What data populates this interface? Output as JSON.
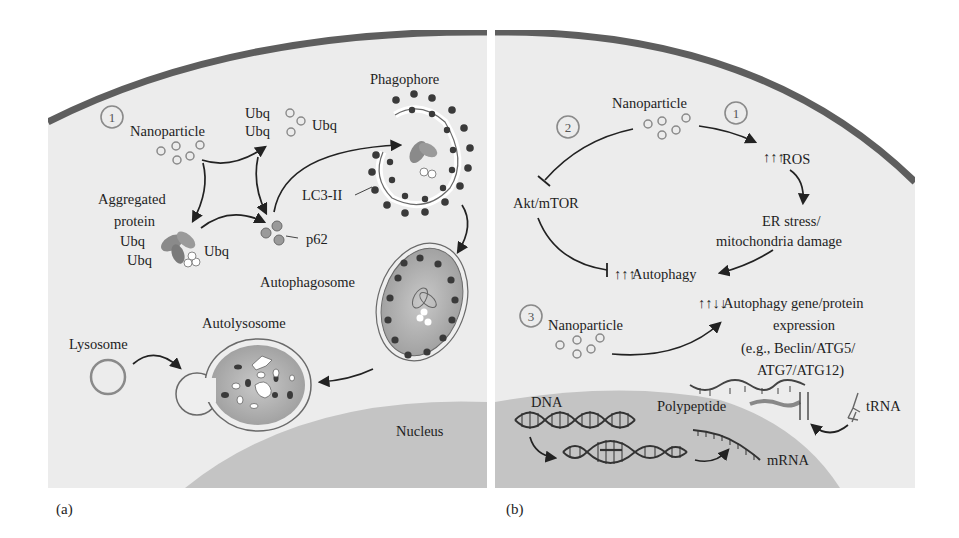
{
  "figure": {
    "panels": [
      {
        "id": "a",
        "label": "(a)",
        "step_number": "1",
        "labels": {
          "nanoparticle": "Nanoparticle",
          "ubq_top_1": "Ubq",
          "ubq_top_2": "Ubq",
          "ubq_top_3": "Ubq",
          "aggregated_protein_line1": "Aggregated",
          "aggregated_protein_line2": "protein",
          "ubq_left_1": "Ubq",
          "ubq_left_2": "Ubq",
          "ubq_right": "Ubq",
          "p62": "p62",
          "lc3": "LC3-II",
          "phagophore": "Phagophore",
          "autophagosome": "Autophagosome",
          "autolysosome": "Autolysosome",
          "lysosome": "Lysosome",
          "nucleus": "Nucleus"
        }
      },
      {
        "id": "b",
        "label": "(b)",
        "step_numbers": [
          "1",
          "2",
          "3"
        ],
        "labels": {
          "nanoparticle_top": "Nanoparticle",
          "ros": "ROS",
          "ros_arrows": "↑↑↑",
          "er_stress_line1": "ER stress/",
          "er_stress_line2": "mitochondria damage",
          "akt_mtor": "Akt/mTOR",
          "autophagy": "Autophagy",
          "autophagy_arrows": "↑↑↑",
          "nanoparticle_bottom": "Nanoparticle",
          "gene_arrows": "↑↑↓↓",
          "gene_line1": "Autophagy gene/protein",
          "gene_line2": "expression",
          "gene_line3": "(e.g., Beclin/ATG5/",
          "gene_line4": "ATG7/ATG12)",
          "dna": "DNA",
          "polypeptide": "Polypeptide",
          "trna": "tRNA",
          "mrna": "mRNA"
        }
      }
    ],
    "colors": {
      "cytoplasm": "#ececec",
      "membrane": "#5e5e5e",
      "nucleus": "#c4c4c4",
      "vesicle_fill": "#a9a9a9",
      "lc3_dot": "#3a3a3a",
      "arrow": "#222222",
      "circle_number": "#7a7a7a"
    }
  }
}
